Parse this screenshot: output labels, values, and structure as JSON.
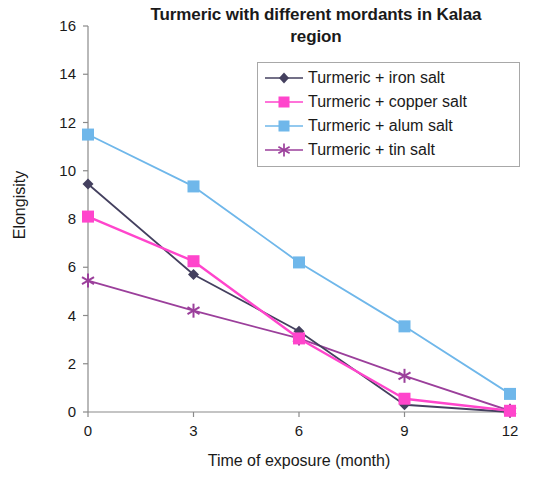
{
  "chart_data": {
    "type": "line",
    "title": "Turmeric with different mordants in Kalaa region",
    "title_line1": "Turmeric with different mordants in Kalaa",
    "title_line2": "region",
    "xlabel": "Time of exposure (month)",
    "ylabel": "Elongisity",
    "x": [
      0,
      3,
      6,
      9,
      12
    ],
    "xticklabels": [
      "0",
      "3",
      "6",
      "9",
      "12"
    ],
    "yticklabels": [
      "0",
      "2",
      "4",
      "6",
      "8",
      "10",
      "12",
      "14",
      "16"
    ],
    "xlim": [
      0,
      12
    ],
    "ylim": [
      0,
      16
    ],
    "grid": false,
    "legend_position": "upper right",
    "series": [
      {
        "name": "Turmeric + iron salt",
        "color": "#44405f",
        "marker": "diamond",
        "values": [
          9.45,
          5.7,
          3.35,
          0.3,
          0.0
        ]
      },
      {
        "name": "Turmeric + copper salt",
        "color": "#ff45cc",
        "marker": "square",
        "values": [
          8.1,
          6.25,
          3.05,
          0.55,
          0.05
        ]
      },
      {
        "name": "Turmeric + alum salt",
        "color": "#6fb7ea",
        "marker": "square",
        "values": [
          11.5,
          9.35,
          6.2,
          3.55,
          0.75
        ]
      },
      {
        "name": "Turmeric + tin salt",
        "color": "#9b3f9b",
        "marker": "star",
        "values": [
          5.45,
          4.2,
          3.05,
          1.5,
          0.05
        ]
      }
    ]
  }
}
